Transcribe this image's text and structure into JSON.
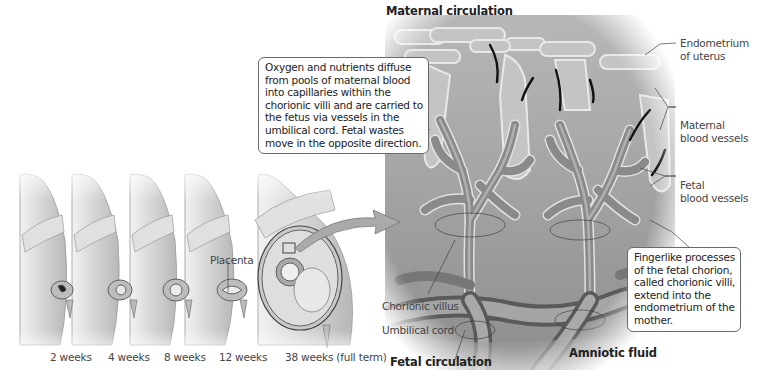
{
  "headings": {
    "maternal_circulation": "Maternal circulation",
    "fetal_circulation": "Fetal circulation",
    "amniotic_fluid": "Amniotic fluid"
  },
  "labels": {
    "placenta": "Placenta",
    "endometrium": [
      "Endometrium",
      "of uterus"
    ],
    "maternal_blood_vessels": [
      "Maternal",
      "blood vessels"
    ],
    "fetal_blood_vessels": [
      "Fetal",
      "blood vessels"
    ],
    "chorionic_villus": "Chorionic villus",
    "umbilical_cord": "Umbilical cord"
  },
  "callouts": {
    "diffusion": [
      "Oxygen and nutrients diffuse",
      "from pools of maternal blood",
      "into capillaries within the",
      "chorionic villi and are carried to",
      "the fetus via vessels in the",
      "umbilical cord. Fetal wastes",
      "move in the opposite direction."
    ],
    "chorionic_villi": [
      "Fingerlike processes",
      "of the fetal chorion,",
      "called chorionic villi,",
      "extend into the",
      "endometrium of the",
      "mother."
    ]
  },
  "stages": [
    {
      "label": "2 weeks"
    },
    {
      "label": "4 weeks"
    },
    {
      "label": "8 weeks"
    },
    {
      "label": "12 weeks"
    },
    {
      "label": "38 weeks (full term)"
    }
  ],
  "colors": {
    "background": "#ffffff",
    "tissue_dark": "#6e6e6e",
    "tissue_mid": "#9a9a9a",
    "tissue_light": "#c8c8c8",
    "skin": "#d9d9d9",
    "vessel_arrow": "#111111",
    "callout_border": "#6a6a6a"
  }
}
